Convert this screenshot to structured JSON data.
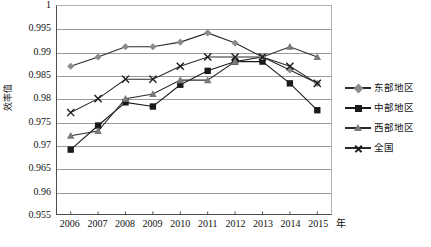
{
  "chart_data": {
    "type": "line",
    "title": "",
    "xlabel": "年",
    "ylabel": "效率值",
    "categories": [
      "2006",
      "2007",
      "2008",
      "2009",
      "2010",
      "2011",
      "2012",
      "2013",
      "2014",
      "2015"
    ],
    "ylim": [
      0.955,
      1
    ],
    "ytick_step": 0.005,
    "yticks": [
      "1",
      "0.995",
      "0.99",
      "0.985",
      "0.98",
      "0.975",
      "0.97",
      "0.965",
      "0.96",
      "0.955"
    ],
    "grid": true,
    "legend_position": "right",
    "series": [
      {
        "name": "东部地区",
        "marker": "diamond",
        "color": "#8c8c8c",
        "line_color": "#2b2b2b",
        "values": [
          0.987,
          0.989,
          0.9912,
          0.9912,
          0.9922,
          0.9942,
          0.992,
          0.989,
          0.9862,
          0.9833
        ]
      },
      {
        "name": "中部地区",
        "marker": "square",
        "color": "#1a1a1a",
        "line_color": "#1a1a1a",
        "values": [
          0.969,
          0.9742,
          0.9792,
          0.9783,
          0.983,
          0.986,
          0.988,
          0.988,
          0.9833,
          0.9775
        ]
      },
      {
        "name": "西部地区",
        "marker": "triangle",
        "color": "#7a7a7a",
        "line_color": "#2b2b2b",
        "values": [
          0.972,
          0.973,
          0.98,
          0.981,
          0.984,
          0.984,
          0.988,
          0.989,
          0.9912,
          0.989
        ]
      },
      {
        "name": "全国",
        "marker": "cross",
        "color": "#1a1a1a",
        "line_color": "#2b2b2b",
        "values": [
          0.977,
          0.98,
          0.9842,
          0.9842,
          0.987,
          0.989,
          0.989,
          0.989,
          0.987,
          0.9833
        ]
      }
    ]
  },
  "axis": {
    "y_title": "效率值",
    "x_unit": "年"
  },
  "legend": {
    "items": [
      {
        "label": "东部地区"
      },
      {
        "label": "中部地区"
      },
      {
        "label": "西部地区"
      },
      {
        "label": "全国"
      }
    ]
  }
}
